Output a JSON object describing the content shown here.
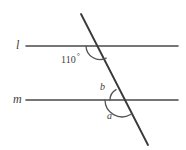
{
  "figure": {
    "kind": "geometry-diagram",
    "canvas": {
      "width": 186,
      "height": 150,
      "background": "#ffffff"
    },
    "stroke_color": "#4a4a4a",
    "transversal_color": "#3a3a3a",
    "arc_color": "#555555"
  },
  "lines": {
    "l": {
      "label": "l",
      "y": 46,
      "x_start": 26,
      "x_end": 178
    },
    "m": {
      "label": "m",
      "y": 100,
      "x_start": 26,
      "x_end": 178
    },
    "transversal": {
      "x1": 81,
      "y1": 14,
      "x2": 148,
      "y2": 145
    }
  },
  "intersections": {
    "at_l": {
      "x": 100,
      "y": 46
    },
    "at_m": {
      "x": 122,
      "y": 100
    }
  },
  "angles": [
    {
      "id": "angle-110",
      "label": "110",
      "degree_symbol": "°",
      "value": 110,
      "at": "l",
      "position": "below-left of transversal at line l"
    },
    {
      "id": "angle-b",
      "label": "b",
      "at": "m",
      "position": "above-left of transversal at line m"
    },
    {
      "id": "angle-a",
      "label": "a",
      "at": "m",
      "position": "below-left of transversal at line m"
    }
  ]
}
